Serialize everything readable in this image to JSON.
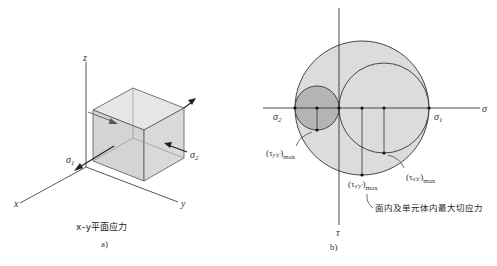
{
  "figure_a": {
    "axis_labels": {
      "x": "x",
      "y": "y",
      "z": "z"
    },
    "stress_labels": {
      "sigma1": "σ",
      "sigma1_sub": "1",
      "sigma2": "σ",
      "sigma2_sub": "2"
    },
    "caption": "x–y平面应力",
    "panel_label": "a)"
  },
  "figure_b": {
    "axis_labels": {
      "sigma": "σ",
      "tau": "τ"
    },
    "principal_labels": {
      "sigma1": "σ",
      "sigma1_sub": "1",
      "sigma2": "σ",
      "sigma2_sub": "2"
    },
    "shear_labels": {
      "tau_yz": {
        "open": "(τ",
        "sub": "y′z′",
        "close": ")",
        "max": "max"
      },
      "tau_xz": {
        "open": "(τ",
        "sub": "x′z′",
        "close": ")",
        "max": "max"
      },
      "tau_xy": {
        "open": "(τ",
        "sub": "x′y′",
        "close": ")",
        "max": "max"
      }
    },
    "annotation": "面内及单元体内最大切应力",
    "panel_label": "b)",
    "colors": {
      "large_circle": "#dcdcdc",
      "small_circle": "#b4b4b4",
      "medium_circle": "#dcdcdc",
      "stroke": "#333333"
    }
  }
}
